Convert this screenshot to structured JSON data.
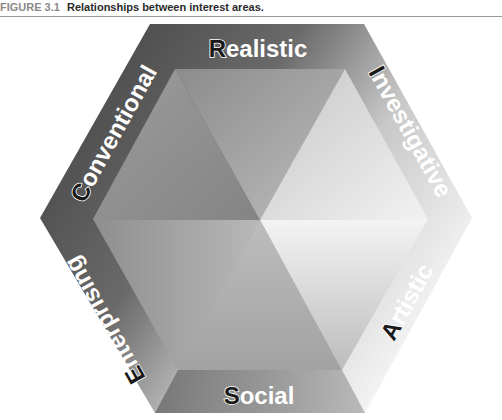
{
  "figure": {
    "label": "FIGURE 3.1",
    "title": "Relationships between interest areas."
  },
  "interest_areas": [
    {
      "name": "Realistic",
      "initial": "R",
      "rest": "ealistic",
      "position": "top"
    },
    {
      "name": "Investigative",
      "initial": "I",
      "rest": "nvestigative",
      "position": "upper-right"
    },
    {
      "name": "Artistic",
      "initial": "A",
      "rest": "rtistic",
      "position": "lower-right"
    },
    {
      "name": "Social",
      "initial": "S",
      "rest": "ocial",
      "position": "bottom"
    },
    {
      "name": "Enterprising",
      "initial": "E",
      "rest": "nterprising",
      "position": "lower-left"
    },
    {
      "name": "Conventional",
      "initial": "C",
      "rest": "onventional",
      "position": "upper-left"
    }
  ],
  "colors": {
    "frame_dark": "#4a4a4a",
    "frame_light": "#d8d8d8",
    "center_light": "#f2f2f2",
    "label_text": "#ffffff",
    "initial_fill": "#1a1a1a"
  }
}
